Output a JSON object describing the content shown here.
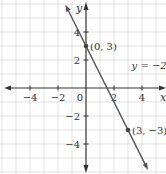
{
  "chart_data": {
    "type": "line",
    "title": "",
    "xlabel": "x",
    "ylabel": "y",
    "xlim": [
      -6,
      6
    ],
    "ylim": [
      -6,
      6
    ],
    "grid": true,
    "x_ticks": [
      -4,
      -2,
      0,
      2,
      4
    ],
    "y_ticks": [
      -4,
      -2,
      2,
      4
    ],
    "x_tick_labels": [
      "−4",
      "−2",
      "0",
      "2",
      "4"
    ],
    "y_tick_labels": [
      "−4",
      "−2",
      "2",
      "4"
    ],
    "series": [
      {
        "name": "y = −2x + 3",
        "slope": -2,
        "intercept": 3,
        "x_range": [
          -1.35,
          4.3
        ],
        "color": "#555555"
      }
    ],
    "points": [
      {
        "x": 0,
        "y": 3,
        "label": "(0, 3)"
      },
      {
        "x": 3,
        "y": -3,
        "label": "(3, −3)"
      }
    ],
    "annotations": [
      {
        "text": "y = −2x + 3",
        "x": 3.4,
        "y": 1.6
      }
    ]
  }
}
